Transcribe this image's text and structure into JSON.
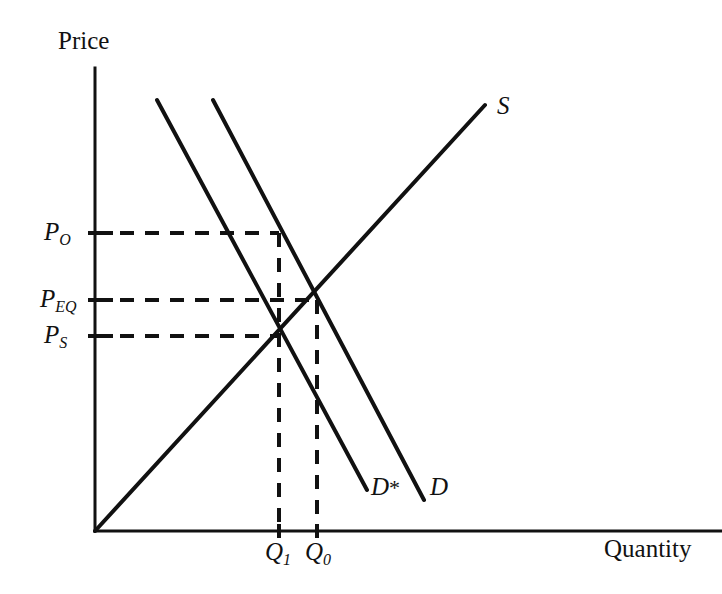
{
  "figure": {
    "kind": "supply-demand-diagram",
    "background_color": "#ffffff",
    "ink_color": "#111111",
    "width": 722,
    "height": 594
  },
  "axes": {
    "y_title": "Price",
    "x_title": "Quantity",
    "origin": {
      "x": 95,
      "y": 531
    },
    "y_axis_top": {
      "x": 95,
      "y": 68
    },
    "x_axis_right": {
      "x": 722,
      "y": 531
    },
    "line_width": 3
  },
  "price_ticks": [
    {
      "id": "P_O",
      "base": "P",
      "sub": "O",
      "y": 233,
      "dash_end_x": 279
    },
    {
      "id": "P_EQ",
      "base": "P",
      "sub": "EQ",
      "y": 300,
      "dash_end_x": 317
    },
    {
      "id": "P_S",
      "base": "P",
      "sub": "S",
      "y": 336,
      "dash_end_x": 279
    }
  ],
  "quantity_ticks": [
    {
      "id": "Q_1",
      "base": "Q",
      "sub": "1",
      "x": 279,
      "top_y": 233
    },
    {
      "id": "Q_0",
      "base": "Q",
      "sub": "0",
      "x": 317,
      "top_y": 300
    }
  ],
  "curves": [
    {
      "id": "supply",
      "label": "S",
      "has_star": false,
      "x1": 95,
      "y1": 531,
      "x2": 485,
      "y2": 105,
      "label_x": 497,
      "label_y": 93
    },
    {
      "id": "demand-shifted",
      "label": "D",
      "has_star": true,
      "x1": 157,
      "y1": 100,
      "x2": 367,
      "y2": 490,
      "label_x": 371,
      "label_y": 474
    },
    {
      "id": "demand",
      "label": "D",
      "has_star": false,
      "x1": 213,
      "y1": 100,
      "x2": 424,
      "y2": 500,
      "label_x": 430,
      "label_y": 474
    }
  ],
  "intersections": [
    {
      "id": "eq-shifted",
      "x": 279,
      "y": 336,
      "price_tick": "P_S",
      "quantity_tick": "Q_1"
    },
    {
      "id": "eq-original",
      "x": 317,
      "y": 300,
      "price_tick": "P_EQ",
      "quantity_tick": "Q_0"
    }
  ],
  "dash_style": {
    "pattern": "14 11",
    "line_width": 4
  },
  "chart_data": {
    "type": "line",
    "title": "",
    "xlabel": "Quantity",
    "ylabel": "Price",
    "grid": false,
    "legend": "inline-curve-labels",
    "xlim": [
      0,
      10
    ],
    "ylim": [
      0,
      10
    ],
    "annotations": [
      {
        "text": "P_O",
        "kind": "y-axis-tick"
      },
      {
        "text": "P_EQ",
        "kind": "y-axis-tick"
      },
      {
        "text": "P_S",
        "kind": "y-axis-tick"
      },
      {
        "text": "Q_1",
        "kind": "x-axis-tick"
      },
      {
        "text": "Q_0",
        "kind": "x-axis-tick"
      },
      {
        "text": "S",
        "kind": "curve-label"
      },
      {
        "text": "D*",
        "kind": "curve-label"
      },
      {
        "text": "D",
        "kind": "curve-label"
      }
    ],
    "series": [
      {
        "name": "S",
        "description": "Supply curve, upward sloping from origin",
        "x": [
          0,
          8.43
        ],
        "y": [
          0,
          9.2
        ]
      },
      {
        "name": "D*",
        "description": "Shifted (leftward) demand curve",
        "x": [
          1.34,
          5.88
        ],
        "y": [
          9.31,
          0.89
        ]
      },
      {
        "name": "D",
        "description": "Original demand curve",
        "x": [
          2.55,
          7.11
        ],
        "y": [
          9.31,
          0.67
        ]
      }
    ],
    "equilibria": [
      {
        "name": "original",
        "quantity_label": "Q_0",
        "price_label": "P_EQ",
        "x": 4.8,
        "y": 4.99
      },
      {
        "name": "shifted",
        "quantity_label": "Q_1",
        "price_label": "P_S",
        "x": 3.98,
        "y": 4.21
      },
      {
        "name": "buyer-price",
        "quantity_label": "Q_1",
        "price_label": "P_O",
        "x": 3.98,
        "y": 6.44
      }
    ]
  }
}
